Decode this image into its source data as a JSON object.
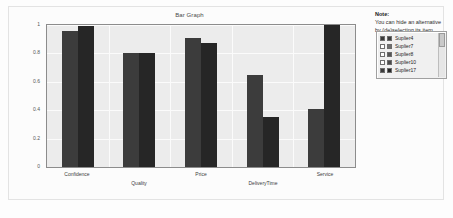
{
  "note": {
    "title": "Note:",
    "line1": "You can hide an alternative",
    "line2": "by (de)selecting its item."
  },
  "legend": {
    "items": [
      {
        "label": "Suplier4",
        "checked": true,
        "color": "#3c3c3c"
      },
      {
        "label": "Suplier7",
        "checked": false,
        "color": "#6e6e6e"
      },
      {
        "label": "Suplier8",
        "checked": false,
        "color": "#555555"
      },
      {
        "label": "Suplier10",
        "checked": false,
        "color": "#4a4a4a"
      },
      {
        "label": "Suplier17",
        "checked": true,
        "color": "#262626"
      }
    ]
  },
  "chart_data": {
    "type": "bar",
    "title": "Bar Graph",
    "xlabel": "",
    "ylabel": "",
    "ylim": [
      0,
      1
    ],
    "yticks": [
      0,
      0.2,
      0.4,
      0.6,
      0.8,
      1
    ],
    "ytick_labels": [
      "0",
      "0.2",
      "0.4",
      "0.6",
      "0.8",
      "1"
    ],
    "grid": true,
    "legend_position": "right",
    "categories": [
      "Confidence",
      "Quality",
      "Price",
      "DeliveryTime",
      "Service"
    ],
    "series": [
      {
        "name": "Suplier4",
        "color": "#3c3c3c",
        "values": [
          0.96,
          0.8,
          0.91,
          0.65,
          0.41
        ]
      },
      {
        "name": "Suplier17",
        "color": "#262626",
        "values": [
          0.99,
          0.8,
          0.87,
          0.35,
          1.0
        ]
      }
    ]
  }
}
